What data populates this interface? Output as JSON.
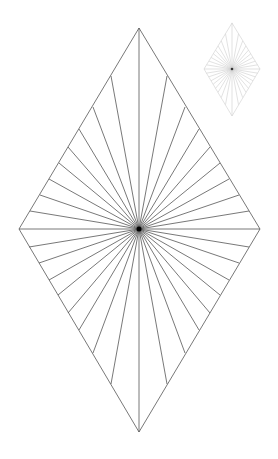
{
  "colors": {
    "background": "#ffffff",
    "main_stroke": "#555555",
    "center_fill": "#000000",
    "thumb_stroke": "#cfcfcf",
    "thumb_center": "#333333"
  },
  "main_rhombus": {
    "center": [
      139,
      229
    ],
    "vertices": {
      "top": [
        139,
        28
      ],
      "right": [
        260,
        229
      ],
      "bottom": [
        139,
        432
      ],
      "left": [
        19,
        229
      ]
    },
    "stroke_width": 0.8,
    "ray_endpoints": [
      [
        139,
        28
      ],
      [
        111,
        76
      ],
      [
        93,
        107
      ],
      [
        79,
        129
      ],
      [
        68,
        147
      ],
      [
        59,
        163
      ],
      [
        49,
        179
      ],
      [
        40,
        195
      ],
      [
        30,
        211
      ],
      [
        19,
        229
      ],
      [
        29,
        247
      ],
      [
        39,
        263
      ],
      [
        49,
        280
      ],
      [
        58,
        295
      ],
      [
        68,
        313
      ],
      [
        79,
        330
      ],
      [
        93,
        353
      ],
      [
        111,
        384
      ],
      [
        139,
        432
      ],
      [
        167,
        384
      ],
      [
        185,
        353
      ],
      [
        199,
        330
      ],
      [
        210,
        313
      ],
      [
        220,
        295
      ],
      [
        229,
        280
      ],
      [
        239,
        263
      ],
      [
        249,
        247
      ],
      [
        260,
        229
      ],
      [
        249,
        211
      ],
      [
        239,
        195
      ],
      [
        229,
        179
      ],
      [
        220,
        163
      ],
      [
        210,
        147
      ],
      [
        199,
        129
      ],
      [
        185,
        107
      ],
      [
        167,
        76
      ]
    ]
  },
  "thumbnail": {
    "center": [
      232,
      69
    ],
    "vertices": {
      "top": [
        232,
        23
      ],
      "right": [
        260,
        69
      ],
      "bottom": [
        232,
        116
      ],
      "left": [
        204,
        69
      ]
    },
    "stroke_width": 0.6,
    "ray_count": 36
  }
}
